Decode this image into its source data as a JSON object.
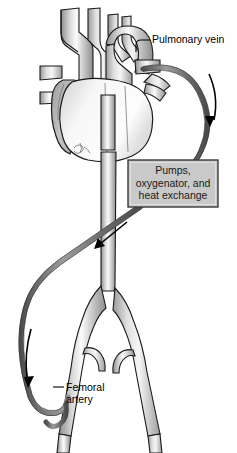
{
  "figure": {
    "background_color": "#ffffff"
  },
  "labels": {
    "pulmonary_vein": "Pulmonary vein",
    "femoral_artery_line1": "Femoral",
    "femoral_artery_line2": "artery"
  },
  "process_box": {
    "line1": "Pumps,",
    "line2": "oxygenator, and",
    "line3": "heat exchange",
    "fill_color": "#c9c9c9",
    "border_color": "#3a3a3a"
  },
  "colors": {
    "vessel_light": "#f2f2f2",
    "vessel_mid": "#b9b9b9",
    "vessel_dark": "#8f8f8f",
    "outline": "#1a1a1a",
    "cannula": "#6e6e6e",
    "arrow": "#000000"
  },
  "flow_arrows": [
    {
      "name": "right-descending-arrow",
      "direction": "down",
      "position": "right tube upper"
    },
    {
      "name": "mid-return-arrow",
      "direction": "down-left",
      "position": "below process box"
    },
    {
      "name": "left-descending-arrow",
      "direction": "down",
      "position": "left tube lower"
    }
  ],
  "anatomy": [
    "brachiocephalic trunk",
    "left common carotid artery",
    "left subclavian artery",
    "aortic arch",
    "pulmonary artery",
    "pulmonary vein",
    "right atrium",
    "left ventricle",
    "descending aorta",
    "common iliac artery",
    "internal iliac artery",
    "femoral artery"
  ]
}
